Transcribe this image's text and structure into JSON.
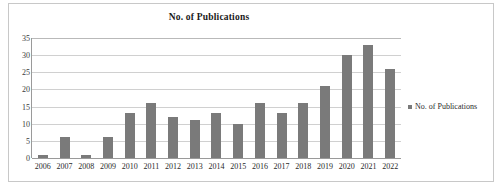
{
  "chart_data": {
    "type": "bar",
    "title": "No. of Publications",
    "xlabel": "",
    "ylabel": "",
    "categories": [
      "2006",
      "2007",
      "2008",
      "2009",
      "2010",
      "2011",
      "2012",
      "2013",
      "2014",
      "2015",
      "2016",
      "2017",
      "2018",
      "2019",
      "2020",
      "2021",
      "2022"
    ],
    "values": [
      1,
      6,
      1,
      6,
      13,
      16,
      12,
      11,
      13,
      10,
      16,
      13,
      16,
      21,
      30,
      33,
      26
    ],
    "series": [
      {
        "name": "No. of Publications",
        "values": [
          1,
          6,
          1,
          6,
          13,
          16,
          12,
          11,
          13,
          10,
          16,
          13,
          16,
          21,
          30,
          33,
          26
        ]
      }
    ],
    "ylim": [
      0,
      35
    ],
    "yticks": [
      0,
      5,
      10,
      15,
      20,
      25,
      30,
      35
    ],
    "ytick_labels": [
      "0",
      "5",
      "10",
      "15",
      "20",
      "25",
      "30",
      "35"
    ],
    "grid": true,
    "legend_position": "right",
    "legend_entries": [
      "No. of Publications"
    ],
    "bar_color": "#7a7a7a",
    "grid_color": "#d0d0d0",
    "axis_color": "#9a9a9a",
    "border_color": "#c8c8c8",
    "background_color": "#ffffff"
  },
  "legend": {
    "marker_name": "legend-square-marker",
    "label": "No. of Publications"
  }
}
